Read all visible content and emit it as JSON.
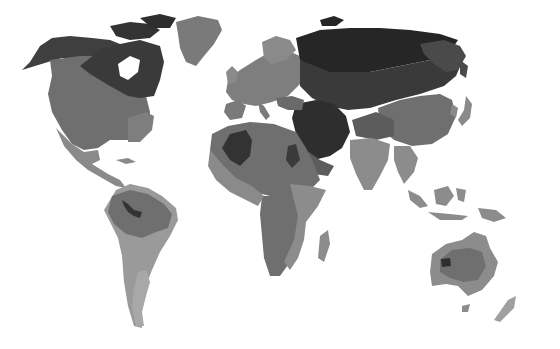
{
  "caption": "High emissions scenario, RCP 8.5",
  "map": {
    "type": "choropleth",
    "projection": "world",
    "style": "grayscale",
    "shades": {
      "darkest": "#262626",
      "dark": "#3f3f3f",
      "mid_dark": "#5c5c5c",
      "mid": "#6f6f6f",
      "light": "#8c8c8c",
      "lighter": "#a3a3a3",
      "ocean": "#ffffff"
    }
  }
}
